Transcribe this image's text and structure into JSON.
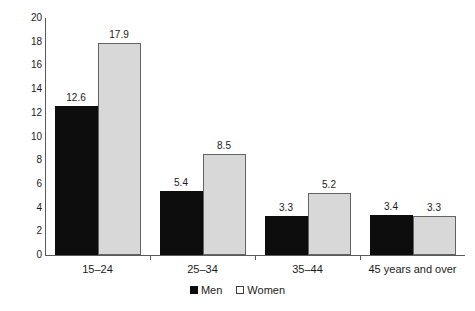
{
  "chart_data": {
    "type": "bar",
    "title": "",
    "subtitle": "",
    "xlabel": "",
    "ylabel": "",
    "categories": [
      "15–24",
      "25–34",
      "35–44",
      "45 years and over"
    ],
    "series": [
      {
        "name": "Men",
        "color": "#0d0d0d",
        "values": [
          12.6,
          5.4,
          3.3,
          3.4
        ]
      },
      {
        "name": "Women",
        "color": "#d8d8d8",
        "values": [
          17.9,
          8.5,
          5.2,
          3.3
        ]
      }
    ],
    "value_labels": [
      [
        "12.6",
        "17.9"
      ],
      [
        "5.4",
        "8.5"
      ],
      [
        "3.3",
        "5.2"
      ],
      [
        "3.4",
        "3.3"
      ]
    ],
    "ylim": [
      0,
      20
    ],
    "ytick_values": [
      0,
      2,
      4,
      6,
      8,
      10,
      12,
      14,
      16,
      18,
      20
    ],
    "ytick_labels": [
      "0",
      "2",
      "4",
      "6",
      "8",
      "10",
      "12",
      "14",
      "16",
      "18",
      "20"
    ],
    "grid": false,
    "legend_position": "bottom-center",
    "legend": [
      {
        "label": "Men",
        "marker": "filled-square",
        "color": "#0d0d0d"
      },
      {
        "label": "Women",
        "marker": "open-square",
        "color": "#ffffff"
      }
    ]
  }
}
